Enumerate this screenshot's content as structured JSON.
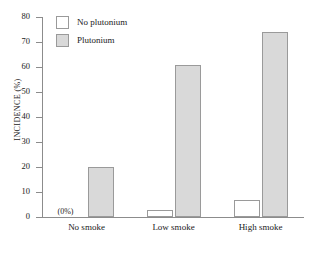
{
  "chart_data": {
    "type": "bar",
    "title": "",
    "xlabel": "",
    "ylabel": "INCIDENCE (%)",
    "ylim": [
      0,
      80
    ],
    "yticks": [
      0,
      10,
      20,
      30,
      40,
      50,
      60,
      70,
      80
    ],
    "ytick_labels": [
      "0",
      "10",
      "20",
      "30",
      "40",
      "50",
      "60",
      "70",
      "80"
    ],
    "grid": false,
    "legend_position": "top-left inside plot",
    "categories": [
      "No smoke",
      "Low smoke",
      "High smoke"
    ],
    "series": [
      {
        "name": "No plutonium",
        "color": "#ffffff",
        "values": [
          0,
          3,
          7
        ],
        "annotations": [
          "(0%)",
          "",
          ""
        ]
      },
      {
        "name": "Plutonium",
        "color": "#d9d9d9",
        "values": [
          20,
          61,
          74
        ],
        "annotations": [
          "",
          "",
          ""
        ]
      }
    ]
  },
  "legend": {
    "items": [
      {
        "label": "No plutonium",
        "swatch": "no-plutonium"
      },
      {
        "label": "Plutonium",
        "swatch": "plutonium"
      }
    ]
  },
  "axis": {
    "y_title": "INCIDENCE (%)"
  },
  "colors": {
    "bar_fill_plutonium": "#d9d9d9",
    "bar_fill_no_plutonium": "#ffffff",
    "bar_border": "#9a9a9a",
    "axis": "#8c8c8c",
    "text": "#1a1a1a"
  }
}
